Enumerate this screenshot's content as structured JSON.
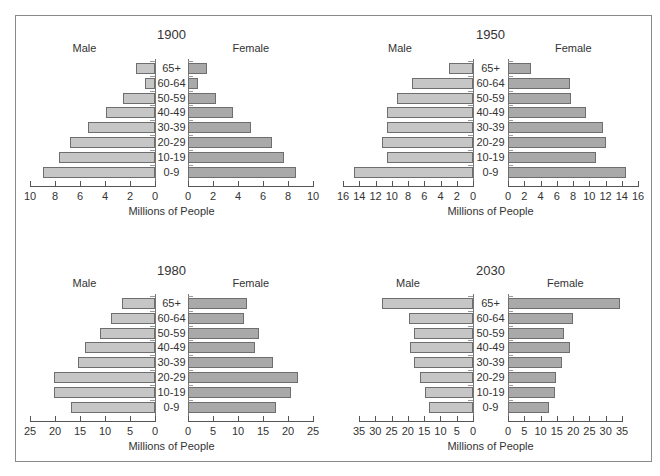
{
  "side_labels": {
    "male": "Male",
    "female": "Female"
  },
  "xlabel": "Millions of People",
  "age_groups": [
    "65+",
    "60-64",
    "50-59",
    "40-49",
    "30-39",
    "20-29",
    "10-19",
    "0-9"
  ],
  "colors": {
    "male": "#c6c6c6",
    "female": "#a9a9a9",
    "border": "#6e6e6e"
  },
  "chart_data": [
    {
      "type": "bar",
      "subtype": "population-pyramid",
      "title": "1900",
      "xlabel": "Millions of People",
      "categories": [
        "65+",
        "60-64",
        "50-59",
        "40-49",
        "30-39",
        "20-29",
        "10-19",
        "0-9"
      ],
      "xlim": [
        0,
        10
      ],
      "ticks": [
        0,
        2,
        4,
        6,
        8,
        10
      ],
      "series": [
        {
          "name": "Male",
          "values": [
            1.5,
            0.8,
            2.6,
            3.9,
            5.4,
            6.8,
            7.7,
            9.0
          ]
        },
        {
          "name": "Female",
          "values": [
            1.5,
            0.8,
            2.2,
            3.6,
            5.0,
            6.7,
            7.7,
            8.6
          ]
        }
      ]
    },
    {
      "type": "bar",
      "subtype": "population-pyramid",
      "title": "1950",
      "xlabel": "Millions of People",
      "categories": [
        "65+",
        "60-64",
        "50-59",
        "40-49",
        "30-39",
        "20-29",
        "10-19",
        "0-9"
      ],
      "xlim": [
        0,
        16
      ],
      "ticks": [
        0,
        2,
        4,
        6,
        8,
        10,
        12,
        14,
        16
      ],
      "series": [
        {
          "name": "Male",
          "values": [
            2.9,
            7.5,
            9.3,
            10.6,
            10.6,
            11.2,
            10.6,
            14.7
          ]
        },
        {
          "name": "Female",
          "values": [
            2.8,
            7.6,
            7.7,
            9.6,
            11.7,
            12.0,
            10.8,
            14.5
          ]
        }
      ]
    },
    {
      "type": "bar",
      "subtype": "population-pyramid",
      "title": "1980",
      "xlabel": "Millions of People",
      "categories": [
        "65+",
        "60-64",
        "50-59",
        "40-49",
        "30-39",
        "20-29",
        "10-19",
        "0-9"
      ],
      "xlim": [
        0,
        25
      ],
      "ticks": [
        0,
        5,
        10,
        15,
        20,
        25
      ],
      "series": [
        {
          "name": "Male",
          "values": [
            6.7,
            8.8,
            11.0,
            14.1,
            15.5,
            20.3,
            20.3,
            16.8
          ]
        },
        {
          "name": "Female",
          "values": [
            11.7,
            11.1,
            14.1,
            13.4,
            17.0,
            21.9,
            20.6,
            17.6
          ]
        }
      ]
    },
    {
      "type": "bar",
      "subtype": "population-pyramid",
      "title": "2030",
      "xlabel": "Millions of People",
      "categories": [
        "65+",
        "60-64",
        "50-59",
        "40-49",
        "30-39",
        "20-29",
        "10-19",
        "0-9"
      ],
      "xlim": [
        0,
        35
      ],
      "ticks": [
        0,
        5,
        10,
        15,
        20,
        25,
        30,
        35
      ],
      "series": [
        {
          "name": "Male",
          "values": [
            27.8,
            19.8,
            18.0,
            19.3,
            18.2,
            16.2,
            14.6,
            13.6
          ]
        },
        {
          "name": "Female",
          "values": [
            34.5,
            19.9,
            17.3,
            19.0,
            16.7,
            14.8,
            14.3,
            12.6
          ]
        }
      ]
    }
  ]
}
